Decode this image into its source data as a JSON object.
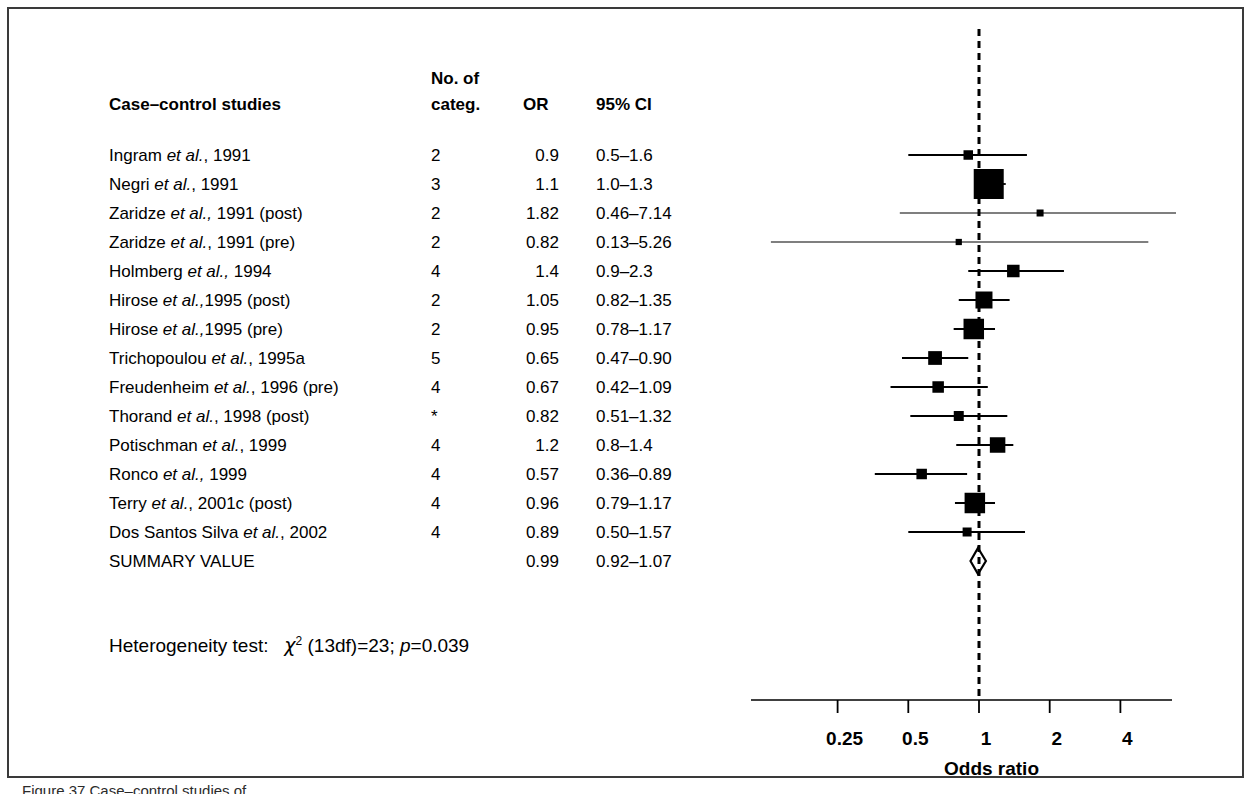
{
  "figure": {
    "caption_partial": "Figure 37 Case–control studies of ..."
  },
  "table": {
    "headers": {
      "study": "Case–control studies",
      "categ_line1": "No. of",
      "categ_line2": "categ.",
      "or": "OR",
      "ci": "95% CI"
    },
    "rows": [
      {
        "study_pre": "Ingram ",
        "study_it": "et al.",
        "study_post": ", 1991",
        "categ": "2",
        "or": "0.9",
        "ci": "0.5–1.6"
      },
      {
        "study_pre": "Negri ",
        "study_it": "et al.",
        "study_post": ", 1991",
        "categ": "3",
        "or": "1.1",
        "ci": "1.0–1.3"
      },
      {
        "study_pre": "Zaridze ",
        "study_it": "et al.,",
        "study_post": " 1991 (post)",
        "categ": "2",
        "or": "1.82",
        "ci": "0.46–7.14"
      },
      {
        "study_pre": "Zaridze ",
        "study_it": "et al.",
        "study_post": ", 1991 (pre)",
        "categ": "2",
        "or": "0.82",
        "ci": "0.13–5.26"
      },
      {
        "study_pre": "Holmberg ",
        "study_it": "et al.,",
        "study_post": " 1994",
        "categ": "4",
        "or": "1.4",
        "ci": "0.9–2.3"
      },
      {
        "study_pre": "Hirose ",
        "study_it": "et al.,",
        "study_post": "1995 (post)",
        "categ": "2",
        "or": "1.05",
        "ci": "0.82–1.35"
      },
      {
        "study_pre": "Hirose ",
        "study_it": "et al.,",
        "study_post": "1995 (pre)",
        "categ": "2",
        "or": "0.95",
        "ci": "0.78–1.17"
      },
      {
        "study_pre": "Trichopoulou ",
        "study_it": "et al.",
        "study_post": ", 1995a",
        "categ": "5",
        "or": "0.65",
        "ci": "0.47–0.90"
      },
      {
        "study_pre": "Freudenheim ",
        "study_it": "et al.",
        "study_post": ", 1996 (pre)",
        "categ": "4",
        "or": "0.67",
        "ci": "0.42–1.09"
      },
      {
        "study_pre": "Thorand ",
        "study_it": "et al.",
        "study_post": ", 1998 (post)",
        "categ": "*",
        "or": "0.82",
        "ci": "0.51–1.32"
      },
      {
        "study_pre": "Potischman ",
        "study_it": "et al.",
        "study_post": ", 1999",
        "categ": "4",
        "or": "1.2",
        "ci": "0.8–1.4"
      },
      {
        "study_pre": "Ronco ",
        "study_it": "et al.,",
        "study_post": " 1999",
        "categ": "4",
        "or": "0.57",
        "ci": "0.36–0.89"
      },
      {
        "study_pre": "Terry ",
        "study_it": "et al.",
        "study_post": ", 2001c (post)",
        "categ": "4",
        "or": "0.96",
        "ci": "0.79–1.17"
      },
      {
        "study_pre": "Dos Santos Silva ",
        "study_it": "et al.",
        "study_post": ", 2002",
        "categ": "4",
        "or": "0.89",
        "ci": "0.50–1.57"
      },
      {
        "study_pre": "SUMMARY VALUE",
        "study_it": "",
        "study_post": "",
        "categ": "",
        "or": "0.99",
        "ci": "0.92–1.07"
      }
    ]
  },
  "heterogeneity": {
    "label": "Heterogeneity test:",
    "chi": "χ",
    "chi_sup": "2",
    "df": " (13df)=23; ",
    "p_italic": "p",
    "p_value": "=0.039"
  },
  "axis": {
    "title": "Odds ratio",
    "ticks": [
      {
        "value": 0.25,
        "label": "0.25"
      },
      {
        "value": 0.5,
        "label": "0.5"
      },
      {
        "value": 1,
        "label": "1"
      },
      {
        "value": 2,
        "label": "2"
      },
      {
        "value": 4,
        "label": "4"
      }
    ],
    "null_line_value": 1
  },
  "chart_data": {
    "type": "forest",
    "title": "Case–control studies",
    "xlabel": "Odds ratio",
    "xscale": "log",
    "xlim": [
      0.17,
      9.0
    ],
    "grid": false,
    "null_value": 1,
    "summary": {
      "label": "SUMMARY VALUE",
      "or": 0.99,
      "ci_low": 0.92,
      "ci_high": 1.07,
      "marker": "open-diamond"
    },
    "heterogeneity": {
      "chi2": 23,
      "df": 13,
      "p": 0.039
    },
    "points": [
      {
        "label": "Ingram et al., 1991",
        "categ": "2",
        "or": 0.9,
        "ci_low": 0.5,
        "ci_high": 1.6,
        "weight": 0.18
      },
      {
        "label": "Negri et al., 1991",
        "categ": "3",
        "or": 1.1,
        "ci_low": 1.0,
        "ci_high": 1.3,
        "weight": 1.0
      },
      {
        "label": "Zaridze et al., 1991 (post)",
        "categ": "2",
        "or": 1.82,
        "ci_low": 0.46,
        "ci_high": 7.14,
        "weight": 0.08
      },
      {
        "label": "Zaridze et al., 1991 (pre)",
        "categ": "2",
        "or": 0.82,
        "ci_low": 0.13,
        "ci_high": 5.26,
        "weight": 0.05
      },
      {
        "label": "Holmberg et al., 1994",
        "categ": "4",
        "or": 1.4,
        "ci_low": 0.9,
        "ci_high": 2.3,
        "weight": 0.3
      },
      {
        "label": "Hirose et al.,1995 (post)",
        "categ": "2",
        "or": 1.05,
        "ci_low": 0.82,
        "ci_high": 1.35,
        "weight": 0.48
      },
      {
        "label": "Hirose et al.,1995 (pre)",
        "categ": "2",
        "or": 0.95,
        "ci_low": 0.78,
        "ci_high": 1.17,
        "weight": 0.62
      },
      {
        "label": "Trichopoulou et al., 1995a",
        "categ": "5",
        "or": 0.65,
        "ci_low": 0.47,
        "ci_high": 0.9,
        "weight": 0.35
      },
      {
        "label": "Freudenheim et al., 1996 (pre)",
        "categ": "4",
        "or": 0.67,
        "ci_low": 0.42,
        "ci_high": 1.09,
        "weight": 0.26
      },
      {
        "label": "Thorand et al., 1998 (post)",
        "categ": "*",
        "or": 0.82,
        "ci_low": 0.51,
        "ci_high": 1.32,
        "weight": 0.2
      },
      {
        "label": "Potischman et al., 1999",
        "categ": "4",
        "or": 1.2,
        "ci_low": 0.8,
        "ci_high": 1.4,
        "weight": 0.42
      },
      {
        "label": "Ronco et al., 1999",
        "categ": "4",
        "or": 0.57,
        "ci_low": 0.36,
        "ci_high": 0.89,
        "weight": 0.22
      },
      {
        "label": "Terry et al., 2001c (post)",
        "categ": "4",
        "or": 0.96,
        "ci_low": 0.79,
        "ci_high": 1.17,
        "weight": 0.62
      },
      {
        "label": "Dos Santos Silva et al., 2002",
        "categ": "4",
        "or": 0.89,
        "ci_low": 0.5,
        "ci_high": 1.57,
        "weight": 0.16
      }
    ]
  }
}
